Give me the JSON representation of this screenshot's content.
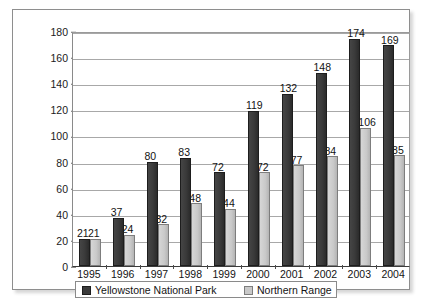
{
  "chart_data": {
    "type": "bar",
    "title": "",
    "xlabel": "",
    "ylabel": "Number of Wolves",
    "ylim": [
      0,
      180
    ],
    "ytick_step": 20,
    "yticks": [
      0,
      20,
      40,
      60,
      80,
      100,
      120,
      140,
      160,
      180
    ],
    "grid": true,
    "grid_axis": "y",
    "legend_position": "bottom",
    "data_labels": true,
    "categories": [
      "1995",
      "1996",
      "1997",
      "1998",
      "1999",
      "2000",
      "2001",
      "2002",
      "2003",
      "2004"
    ],
    "series": [
      {
        "name": "Yellowstone National Park",
        "color": "#3a3a3a",
        "values": [
          21,
          37,
          80,
          83,
          72,
          119,
          132,
          148,
          174,
          169
        ]
      },
      {
        "name": "Northern Range",
        "color": "#c9c9c9",
        "values": [
          21,
          24,
          32,
          48,
          44,
          72,
          77,
          84,
          106,
          85
        ]
      }
    ]
  },
  "legend": {
    "entries": [
      {
        "label": "Yellowstone National Park",
        "swatch": "dark"
      },
      {
        "label": "Northern Range",
        "swatch": "light"
      }
    ]
  }
}
